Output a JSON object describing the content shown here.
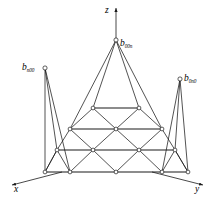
{
  "figure": {
    "background": "#ffffff",
    "stroke": "#1a1a1a",
    "node_fill": "#ffffff",
    "degree_label": "n"
  },
  "axes": [
    {
      "name": "x-axis",
      "label": "x",
      "label_x": 14,
      "label_y": 190,
      "from": [
        62,
        172
      ],
      "to": [
        10,
        186
      ]
    },
    {
      "name": "y-axis",
      "label": "y",
      "label_x": 196,
      "label_y": 190,
      "from": [
        152,
        172
      ],
      "to": [
        205,
        186
      ]
    },
    {
      "name": "z-axis",
      "label": "z",
      "label_x": 105,
      "label_y": 13,
      "from": [
        116,
        40
      ],
      "to": [
        116,
        6
      ]
    }
  ],
  "control_points": [
    {
      "name": "b-n00",
      "base": "b",
      "sub": "n00",
      "px": 45,
      "py": 68,
      "label_x": 22,
      "label_y": 64
    },
    {
      "name": "b-00n",
      "base": "b",
      "sub": "00n",
      "px": 116,
      "py": 40,
      "label_x": 120,
      "label_y": 42
    },
    {
      "name": "b-0n0",
      "base": "b",
      "sub": "0n0",
      "px": 180,
      "py": 79,
      "label_x": 183,
      "label_y": 76
    }
  ],
  "net": {
    "rows": [
      {
        "row": 0,
        "nodes": [
          [
            116,
            40
          ]
        ]
      },
      {
        "row": 1,
        "nodes": [
          [
            93,
            108
          ],
          [
            139,
            108
          ]
        ]
      },
      {
        "row": 2,
        "nodes": [
          [
            70,
            129
          ],
          [
            116,
            129
          ],
          [
            162,
            129
          ]
        ]
      },
      {
        "row": 3,
        "nodes": [
          [
            57,
            150
          ],
          [
            93,
            150
          ],
          [
            139,
            150
          ],
          [
            175,
            150
          ]
        ]
      },
      {
        "row": 4,
        "nodes": [
          [
            45,
            172
          ],
          [
            70,
            172
          ],
          [
            116,
            172
          ],
          [
            162,
            172
          ],
          [
            188,
            172
          ]
        ]
      }
    ],
    "corner_nodes": [
      "b-n00",
      "b-00n",
      "b-0n0"
    ]
  }
}
